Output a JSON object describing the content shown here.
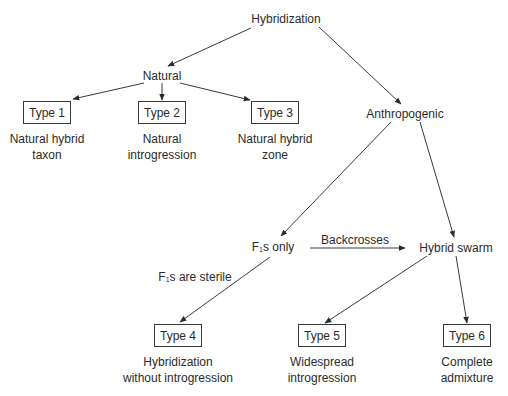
{
  "diagram": {
    "root": "Hybridization",
    "branches": {
      "natural": "Natural",
      "anthropogenic": "Anthropogenic"
    },
    "intermediate": {
      "f1_prefix": "F",
      "f1_sub": "1",
      "f1_only_suffix": "s only",
      "hybrid_swarm": "Hybrid swarm",
      "backcrosses_label": "Backcrosses",
      "sterile_suffix": "s are sterile"
    },
    "types": [
      {
        "label": "Type 1",
        "caption_line1": "Natural hybrid",
        "caption_line2": "taxon"
      },
      {
        "label": "Type 2",
        "caption_line1": "Natural",
        "caption_line2": "introgression"
      },
      {
        "label": "Type 3",
        "caption_line1": "Natural hybrid",
        "caption_line2": "zone"
      },
      {
        "label": "Type 4",
        "caption_line1": "Hybridization",
        "caption_line2": "without introgression"
      },
      {
        "label": "Type 5",
        "caption_line1": "Widespread",
        "caption_line2": "introgression"
      },
      {
        "label": "Type 6",
        "caption_line1": "Complete",
        "caption_line2": "admixture"
      }
    ],
    "colors": {
      "line": "#3a3a3a",
      "text": "#2b2b2b",
      "background": "#ffffff"
    }
  }
}
